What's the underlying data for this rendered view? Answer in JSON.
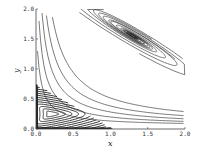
{
  "chart_data": {
    "type": "line",
    "title": "",
    "xlabel": "x",
    "ylabel": "y",
    "xlim": [
      0.0,
      2.0
    ],
    "ylim": [
      0.0,
      2.0
    ],
    "grid": false,
    "legend": null,
    "x_ticks": [
      "0.0",
      "0.5",
      "1.0",
      "1.5",
      "2.0"
    ],
    "y_ticks": [
      "0.0",
      "0.5",
      "1.0",
      "1.5",
      "2.0"
    ],
    "features": [
      {
        "kind": "spiral_focus",
        "center": [
          1.3,
          1.55
        ]
      },
      {
        "kind": "limit_cycle_region",
        "center": [
          0.2,
          0.25
        ],
        "extent": {
          "x": [
            0.0,
            1.0
          ],
          "y": [
            0.0,
            0.75
          ]
        }
      }
    ]
  },
  "axes": {
    "x_label": "x",
    "y_label": "y"
  }
}
